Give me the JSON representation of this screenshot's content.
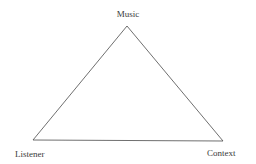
{
  "diagram": {
    "type": "triangle",
    "nodes": [
      {
        "id": "music",
        "label": "Music",
        "position": "top"
      },
      {
        "id": "listener",
        "label": "Listener",
        "position": "bottom-left"
      },
      {
        "id": "context",
        "label": "Context",
        "position": "bottom-right"
      }
    ],
    "edges": [
      {
        "from": "music",
        "to": "listener"
      },
      {
        "from": "listener",
        "to": "context"
      },
      {
        "from": "context",
        "to": "music"
      }
    ],
    "line_color": "#4a4a4a",
    "text_color": "#3a3a3a"
  }
}
